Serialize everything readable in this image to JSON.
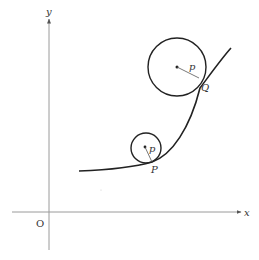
{
  "diagram": {
    "axes": {
      "x_label": "x",
      "y_label": "y",
      "origin_label": "O"
    },
    "circles": [
      {
        "id": "small",
        "radius_label": "p",
        "tangent_point_label": "P"
      },
      {
        "id": "large",
        "radius_label": "p",
        "tangent_point_label": "Q"
      }
    ],
    "colors": {
      "axis": "#9a9a9a",
      "curve": "#222222",
      "circle": "#222222",
      "text": "#333333"
    }
  }
}
